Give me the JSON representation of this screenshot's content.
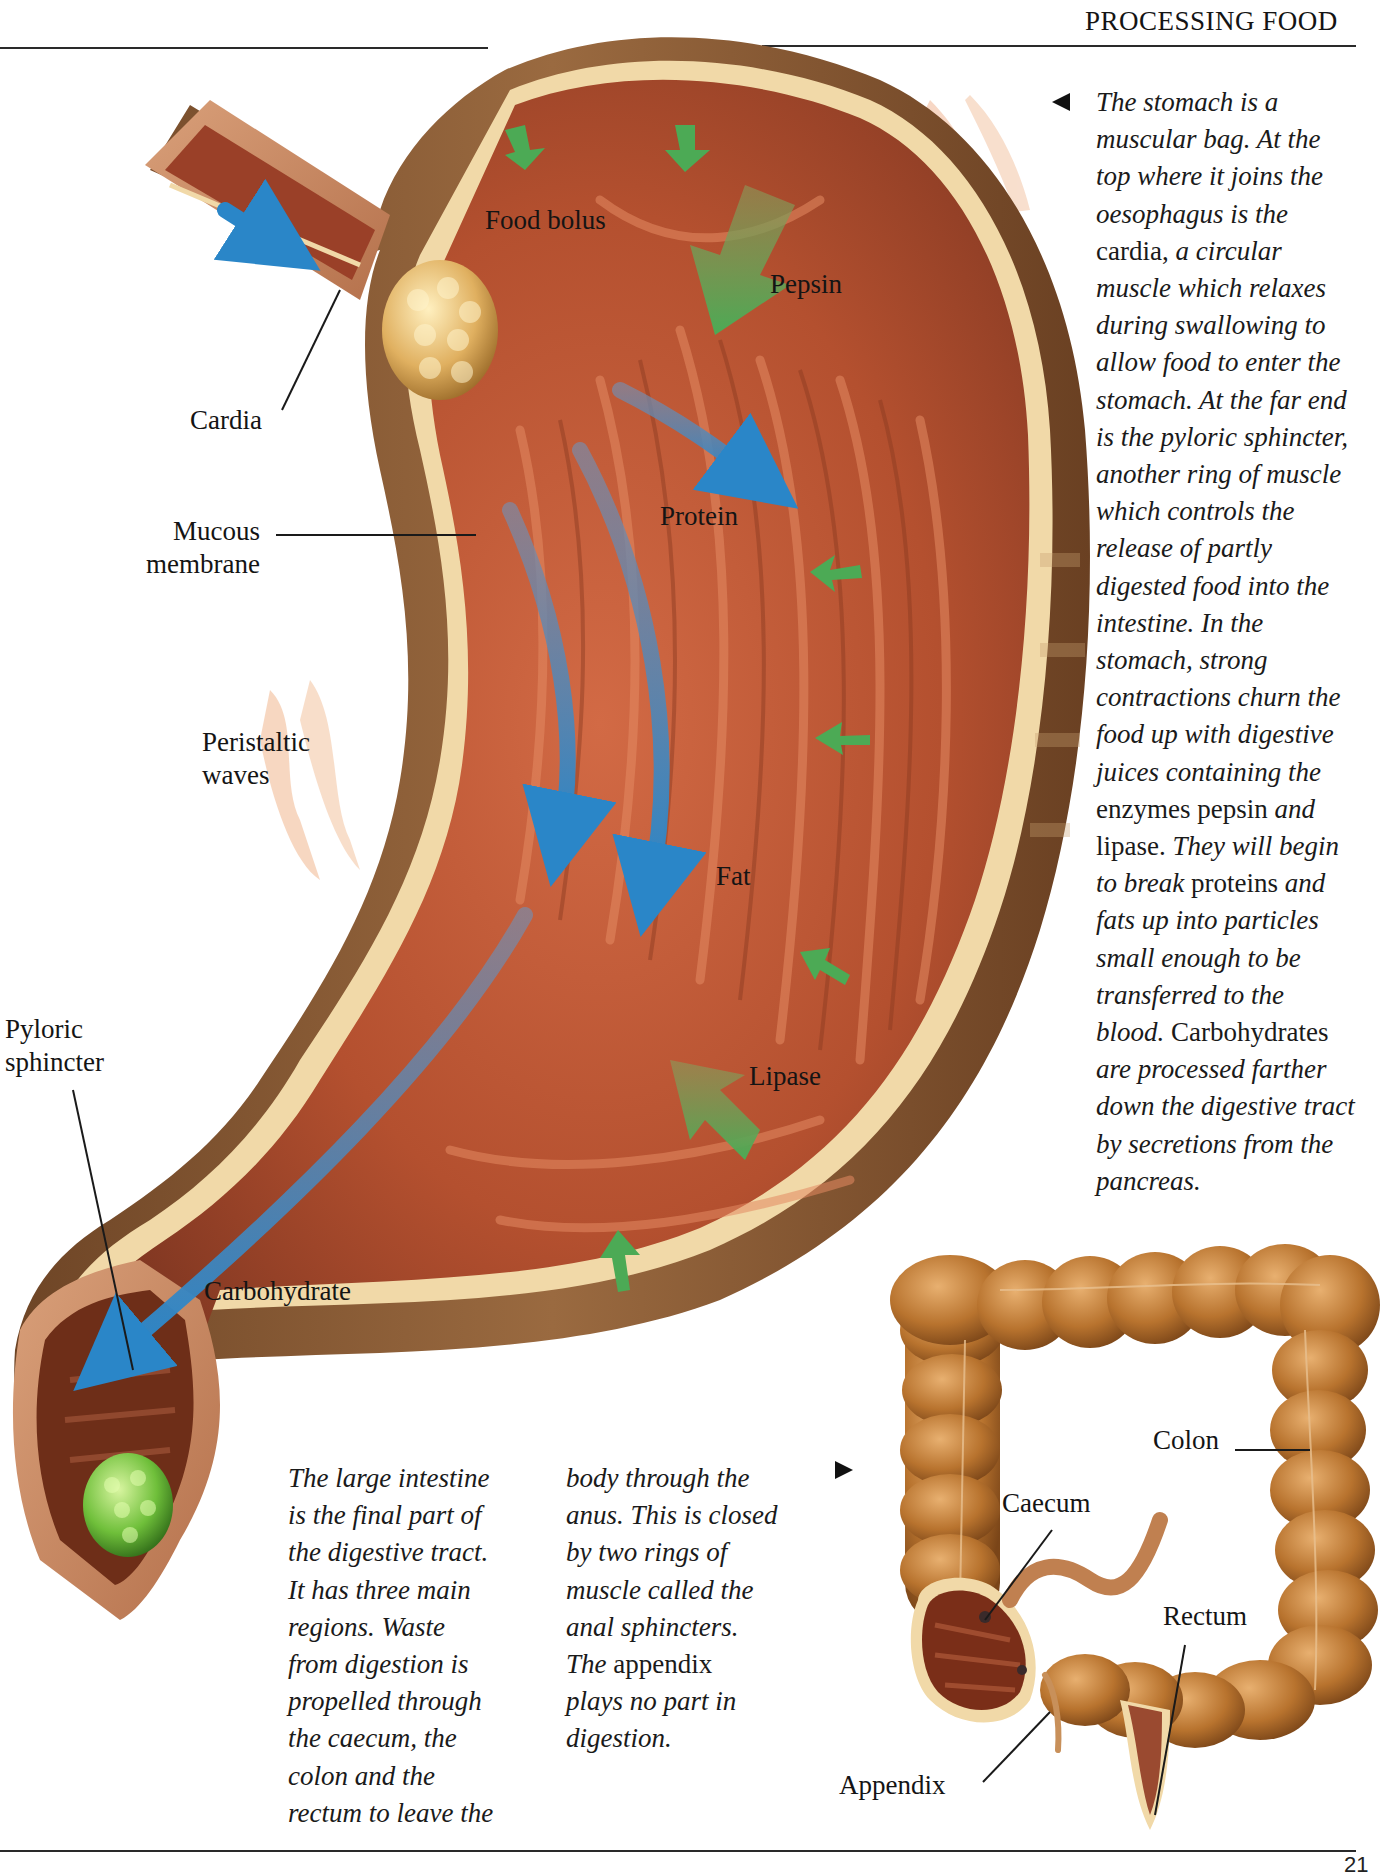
{
  "page": {
    "running_head": "PROCESSING FOOD",
    "page_number": "21"
  },
  "colors": {
    "stomach_wall": "#a65a3a",
    "stomach_inner": "#b4502f",
    "stomach_outer": "#8a5a35",
    "membrane_edge": "#f1d9a8",
    "enzyme_arrow": "#4caa55",
    "flow_arrow": "#2a86c8",
    "colon": "#b8732e",
    "food_bolus": "#e0b060",
    "waste": "#6fbf3a"
  },
  "stomach_figure": {
    "labels": {
      "food_bolus": "Food bolus",
      "pepsin": "Pepsin",
      "cardia": "Cardia",
      "mucous_membrane_1": "Mucous",
      "mucous_membrane_2": "membrane",
      "protein": "Protein",
      "peristaltic_1": "Peristaltic",
      "peristaltic_2": "waves",
      "fat": "Fat",
      "pyloric_1": "Pyloric",
      "pyloric_2": "sphincter",
      "lipase": "Lipase",
      "carbohydrate": "Carbohydrate"
    },
    "icons": {
      "pointer_left": "triangle-left",
      "pointer_right": "triangle-right"
    }
  },
  "stomach_caption": {
    "lines": [
      {
        "i": "The stomach is a"
      },
      {
        "i": "muscular bag. At the"
      },
      {
        "i": "top where it joins the"
      },
      {
        "i": "oesophagus is the"
      },
      {
        "r": "cardia,",
        "i": " a circular"
      },
      {
        "i": "muscle which relaxes"
      },
      {
        "i": "during swallowing to"
      },
      {
        "i": "allow food to enter the"
      },
      {
        "i": "stomach. At the far end"
      },
      {
        "i": "is the pyloric sphincter,"
      },
      {
        "i": "another ring of muscle"
      },
      {
        "i": "which controls the"
      },
      {
        "i": "release of partly"
      },
      {
        "i": "digested food into the"
      },
      {
        "i": "intestine. In the"
      },
      {
        "i": "stomach, strong"
      },
      {
        "i": "contractions churn the"
      },
      {
        "i": "food up with digestive"
      },
      {
        "i": "juices containing the"
      },
      {
        "r": "enzymes pepsin",
        "i": " and"
      },
      {
        "r": "lipase.",
        "i": " They will begin"
      },
      {
        "i": "to break ",
        "r": "proteins",
        "i2": " and"
      },
      {
        "i": "fats up into particles"
      },
      {
        "i": "small enough to be"
      },
      {
        "i": "transferred to the"
      },
      {
        "i": "blood. ",
        "r": "Carbohydrates"
      },
      {
        "i": "are processed farther"
      },
      {
        "i": "down the digestive tract"
      },
      {
        "i": "by secretions from the"
      },
      {
        "i": "pancreas."
      }
    ]
  },
  "intestine_caption": {
    "col1": [
      {
        "i": "The large intestine"
      },
      {
        "i": "is the final part of"
      },
      {
        "i": "the digestive tract."
      },
      {
        "i": "It has three main"
      },
      {
        "i": "regions. Waste"
      },
      {
        "i": "from digestion is"
      },
      {
        "i": "propelled through"
      },
      {
        "i": "the caecum, the"
      },
      {
        "i": "colon and the"
      },
      {
        "i": "rectum to leave the"
      }
    ],
    "col2": [
      {
        "i": "body through the"
      },
      {
        "i": "anus. This is closed"
      },
      {
        "i": "by two rings of"
      },
      {
        "i": "muscle called the"
      },
      {
        "i": "anal sphincters."
      },
      {
        "i": "The ",
        "r": "appendix"
      },
      {
        "i": "plays no part in"
      },
      {
        "i": "digestion."
      }
    ]
  },
  "intestine_figure": {
    "labels": {
      "colon": "Colon",
      "caecum": "Caecum",
      "rectum": "Rectum",
      "appendix": "Appendix"
    }
  }
}
